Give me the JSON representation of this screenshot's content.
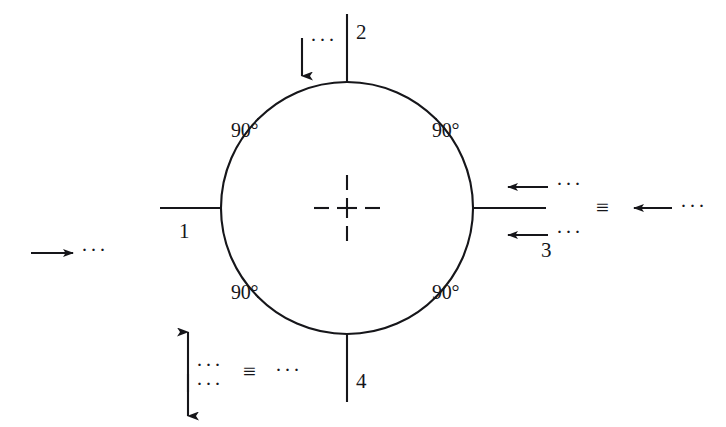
{
  "figure": {
    "type": "engineering-drawing",
    "background_color": "#ffffff",
    "ink_color": "#16161a"
  },
  "geometry": {
    "circle_center_x": 347,
    "circle_center_y": 208,
    "circle_radius": 125,
    "arc_gap_degrees": 22,
    "arc_count": 4
  },
  "angles": {
    "top_left": "90°",
    "top_right": "90°",
    "bottom_left": "90°",
    "bottom_right": "90°"
  },
  "positions": {
    "left": "1",
    "top": "2",
    "right": "3",
    "bottom": "4"
  },
  "symbols": {
    "identical_symbol": "≡",
    "ellipsis": "···",
    "center_mark": "center-mark-plus"
  },
  "annotations": {
    "far_left": {
      "arrow_direction": "right",
      "ellipsis": "···"
    },
    "top": {
      "arrow_direction": "down",
      "ellipsis": "···"
    },
    "right_upper": {
      "arrow_direction": "left",
      "ellipsis": "···"
    },
    "right_lower": {
      "arrow_direction": "left",
      "ellipsis": "···"
    },
    "right_equivalent": {
      "identical_symbol": "≡",
      "arrow_direction": "left",
      "ellipsis": "···"
    },
    "bottom_left_up": {
      "arrow_direction": "up",
      "ellipsis": "···"
    },
    "bottom_left_down": {
      "arrow_direction": "down",
      "ellipsis": "···"
    },
    "bottom_left_equivalent": {
      "identical_symbol": "≡",
      "ellipsis": "···"
    }
  }
}
